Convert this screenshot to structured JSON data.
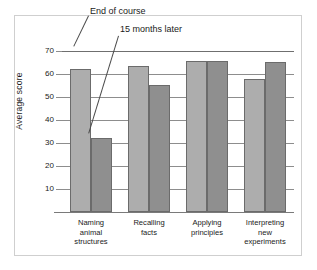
{
  "chart_data": {
    "type": "bar",
    "title": "",
    "xlabel": "",
    "ylabel": "Average score",
    "ylim": [
      0,
      73
    ],
    "yticks": [
      10,
      20,
      30,
      40,
      50,
      60,
      70
    ],
    "grid": true,
    "legend_position": "annotations",
    "categories": [
      "Naming animal structures",
      "Recalling facts",
      "Applying principles",
      "Interpreting new experiments"
    ],
    "category_lines": [
      [
        "Naming",
        "animal",
        "structures"
      ],
      [
        "Recalling",
        "facts"
      ],
      [
        "Applying",
        "principles"
      ],
      [
        "Interpreting",
        "new",
        "experiments"
      ]
    ],
    "series": [
      {
        "name": "End of course",
        "color": "#adadad",
        "values": [
          62,
          63.5,
          65.5,
          58
        ]
      },
      {
        "name": "15 months later",
        "color": "#8f8f8f",
        "values": [
          32,
          55,
          65.5,
          65
        ]
      }
    ],
    "annotations": [
      {
        "text": "End of course"
      },
      {
        "text": "15 months later"
      }
    ]
  },
  "axis": {
    "ytick_labels": [
      "70",
      "60",
      "50",
      "40",
      "30",
      "20",
      "10"
    ],
    "y_title": "Average score"
  }
}
